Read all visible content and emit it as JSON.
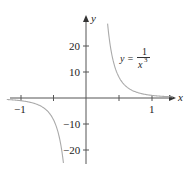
{
  "chart_data": {
    "type": "line",
    "title": "",
    "function": "y = 1/x^3",
    "xlabel": "x",
    "ylabel": "y",
    "xlim": [
      -1.2,
      1.3
    ],
    "ylim": [
      -25,
      28
    ],
    "x_ticks": [
      -1,
      -0.5,
      0.5,
      1
    ],
    "x_tick_labels": [
      "-1",
      "1"
    ],
    "y_ticks": [
      20,
      10,
      -10,
      -20
    ],
    "y_tick_labels": [
      "20",
      "10",
      "-10",
      "-20"
    ],
    "grid": false,
    "annotation": "y = 1/x³",
    "series": [
      {
        "name": "y = 1/x^3 (x>0)",
        "x": [
          0.33,
          0.4,
          0.5,
          0.6,
          0.7,
          0.8,
          1.0,
          1.2,
          1.3
        ],
        "y": [
          27.8,
          15.6,
          8.0,
          4.6,
          2.9,
          1.95,
          1.0,
          0.58,
          0.46
        ]
      },
      {
        "name": "y = 1/x^3 (x<0)",
        "x": [
          -1.2,
          -1.0,
          -0.8,
          -0.7,
          -0.6,
          -0.5,
          -0.4,
          -0.34
        ],
        "y": [
          -0.58,
          -1.0,
          -1.95,
          -2.9,
          -4.6,
          -8.0,
          -15.6,
          -25.4
        ]
      }
    ],
    "colors": {
      "curve": "#aaaaaa",
      "axes": "#444444"
    }
  },
  "labels": {
    "x_axis": "x",
    "y_axis": "y",
    "xt_neg1": "−1",
    "xt_1": "1",
    "yt_20": "20",
    "yt_10": "10",
    "yt_m10": "−10",
    "yt_m20": "−20",
    "eq_lhs": "y =",
    "eq_num": "1",
    "eq_den": "x",
    "eq_exp": "3"
  }
}
